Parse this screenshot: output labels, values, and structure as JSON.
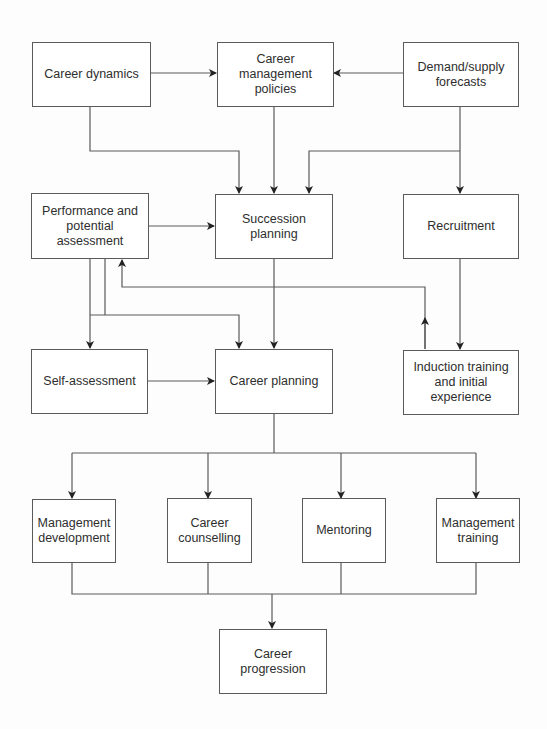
{
  "diagram": {
    "type": "flowchart",
    "nodes": [
      {
        "id": "career_dynamics",
        "label": "Career dynamics"
      },
      {
        "id": "career_management_policies",
        "label": "Career management\npolicies"
      },
      {
        "id": "demand_supply_forecasts",
        "label": "Demand/supply\nforecasts"
      },
      {
        "id": "performance_potential_assessment",
        "label": "Performance and\npotential\nassessment"
      },
      {
        "id": "succession_planning",
        "label": "Succession planning"
      },
      {
        "id": "recruitment",
        "label": "Recruitment"
      },
      {
        "id": "self_assessment",
        "label": "Self-assessment"
      },
      {
        "id": "career_planning",
        "label": "Career planning"
      },
      {
        "id": "induction_training",
        "label": "Induction training\nand initial\nexperience"
      },
      {
        "id": "management_development",
        "label": "Management\ndevelopment"
      },
      {
        "id": "career_counselling",
        "label": "Career\ncounselling"
      },
      {
        "id": "mentoring",
        "label": "Mentoring"
      },
      {
        "id": "management_training",
        "label": "Management\ntraining"
      },
      {
        "id": "career_progression",
        "label": "Career\nprogression"
      }
    ],
    "edges": [
      {
        "from": "career_dynamics",
        "to": "career_management_policies"
      },
      {
        "from": "demand_supply_forecasts",
        "to": "career_management_policies"
      },
      {
        "from": "career_dynamics",
        "to": "succession_planning"
      },
      {
        "from": "career_management_policies",
        "to": "succession_planning"
      },
      {
        "from": "demand_supply_forecasts",
        "to": "succession_planning"
      },
      {
        "from": "demand_supply_forecasts",
        "to": "recruitment"
      },
      {
        "from": "performance_potential_assessment",
        "to": "succession_planning"
      },
      {
        "from": "performance_potential_assessment",
        "to": "self_assessment"
      },
      {
        "from": "performance_potential_assessment",
        "to": "career_planning"
      },
      {
        "from": "succession_planning",
        "to": "career_planning"
      },
      {
        "from": "recruitment",
        "to": "induction_training"
      },
      {
        "from": "induction_training",
        "to": "performance_potential_assessment"
      },
      {
        "from": "self_assessment",
        "to": "career_planning"
      },
      {
        "from": "career_planning",
        "to": "management_development"
      },
      {
        "from": "career_planning",
        "to": "career_counselling"
      },
      {
        "from": "career_planning",
        "to": "mentoring"
      },
      {
        "from": "career_planning",
        "to": "management_training"
      },
      {
        "from": "management_development",
        "to": "career_progression"
      },
      {
        "from": "career_counselling",
        "to": "career_progression"
      },
      {
        "from": "mentoring",
        "to": "career_progression"
      },
      {
        "from": "management_training",
        "to": "career_progression"
      }
    ]
  }
}
